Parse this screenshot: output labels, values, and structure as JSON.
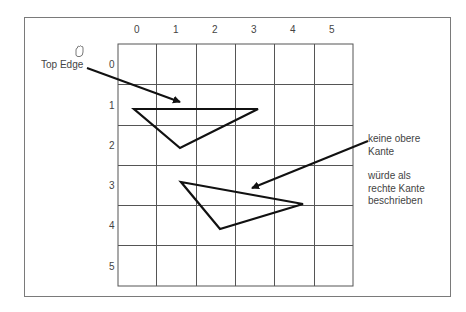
{
  "diagram": {
    "column_labels": [
      "0",
      "1",
      "2",
      "3",
      "4",
      "5"
    ],
    "row_labels": [
      "0",
      "1",
      "2",
      "3",
      "4",
      "5"
    ],
    "grid": {
      "cols": 6,
      "rows": 6,
      "left": 118,
      "top": 44,
      "cell_w": 39.2,
      "cell_h": 40.3
    },
    "annotations": {
      "top_edge": "Top Edge",
      "no_top_edge_line1": "keine obere",
      "no_top_edge_line2": "Kante",
      "right_edge_line1": "würde als",
      "right_edge_line2": "rechte Kante",
      "right_edge_line3": "beschrieben"
    },
    "triangles": [
      {
        "name": "triangle-top-edge",
        "points": "134,109 258,109 180,148"
      },
      {
        "name": "triangle-no-top-edge",
        "points": "181,182 303,204 220,229"
      }
    ],
    "colors": {
      "grid": "#555555",
      "shape": "#111111",
      "text": "#444444",
      "frame": "#7a7a7a"
    }
  }
}
